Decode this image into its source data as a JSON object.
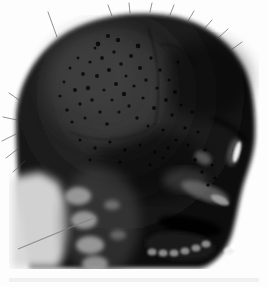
{
  "meta": {
    "image_type": "radiograph"
  },
  "palette": {
    "background": "#fdfdfd",
    "skull_edge_dark": "#050505",
    "skull_mid": "#222222",
    "cranium_light_patch": "#3a3a3a",
    "neck_light": "#d8d8d8",
    "bone_gray": "#a8a8a8",
    "teeth_gray": "#9e9e9e",
    "nasal_highlight": "#fafafa",
    "film_strip": "#ececec"
  },
  "pellets": [
    [
      60,
      96,
      1.6
    ],
    [
      64,
      82,
      1.4
    ],
    [
      67,
      110,
      1.8
    ],
    [
      70,
      68,
      1.5
    ],
    [
      72,
      122,
      1.6
    ],
    [
      75,
      90,
      2.0
    ],
    [
      78,
      58,
      1.4
    ],
    [
      80,
      104,
      1.7
    ],
    [
      83,
      74,
      1.9
    ],
    [
      85,
      118,
      1.5
    ],
    [
      88,
      88,
      2.2
    ],
    [
      90,
      62,
      1.6
    ],
    [
      92,
      100,
      1.8
    ],
    [
      95,
      48,
      1.5
    ],
    [
      97,
      76,
      2.0
    ],
    [
      100,
      112,
      1.7
    ],
    [
      102,
      58,
      1.9
    ],
    [
      104,
      90,
      1.6
    ],
    [
      107,
      124,
      1.8
    ],
    [
      109,
      70,
      2.1
    ],
    [
      112,
      100,
      1.5
    ],
    [
      114,
      52,
      1.7
    ],
    [
      116,
      84,
      2.0
    ],
    [
      119,
      112,
      1.6
    ],
    [
      121,
      64,
      1.8
    ],
    [
      124,
      94,
      2.2
    ],
    [
      126,
      76,
      1.5
    ],
    [
      129,
      106,
      1.7
    ],
    [
      131,
      56,
      1.9
    ],
    [
      134,
      86,
      1.6
    ],
    [
      98,
      44,
      2.4
    ],
    [
      118,
      40,
      2.2
    ],
    [
      138,
      46,
      2.4
    ],
    [
      108,
      36,
      2.0
    ],
    [
      137,
      118,
      1.8
    ],
    [
      140,
      68,
      2.0
    ],
    [
      143,
      98,
      1.6
    ],
    [
      146,
      80,
      1.8
    ],
    [
      148,
      126,
      1.5
    ],
    [
      151,
      58,
      1.7
    ],
    [
      154,
      108,
      2.0
    ],
    [
      157,
      88,
      1.6
    ],
    [
      160,
      70,
      1.8
    ],
    [
      163,
      130,
      1.6
    ],
    [
      166,
      100,
      1.9
    ],
    [
      169,
      80,
      1.5
    ],
    [
      172,
      115,
      1.7
    ],
    [
      175,
      92,
      2.0
    ],
    [
      178,
      62,
      1.5
    ],
    [
      181,
      105,
      1.6
    ],
    [
      185,
      128,
      1.8
    ],
    [
      188,
      145,
      1.6
    ],
    [
      192,
      112,
      1.7
    ],
    [
      195,
      160,
      1.9
    ],
    [
      198,
      132,
      1.5
    ],
    [
      202,
      172,
      1.7
    ],
    [
      205,
      150,
      1.6
    ],
    [
      208,
      185,
      1.8
    ],
    [
      212,
      165,
      1.5
    ],
    [
      215,
      178,
      1.6
    ],
    [
      80,
      140,
      1.5
    ],
    [
      95,
      148,
      1.7
    ],
    [
      110,
      142,
      1.6
    ],
    [
      125,
      150,
      1.8
    ],
    [
      140,
      145,
      1.5
    ],
    [
      155,
      152,
      1.6
    ],
    [
      168,
      148,
      1.7
    ],
    [
      90,
      160,
      1.4
    ],
    [
      120,
      162,
      1.5
    ],
    [
      150,
      165,
      1.6
    ],
    [
      176,
      140,
      1.5
    ],
    [
      163,
      158,
      1.4
    ]
  ],
  "hair_wisps": [
    [
      112,
      16,
      108,
      5
    ],
    [
      130,
      13,
      129,
      3
    ],
    [
      150,
      12,
      152,
      3
    ],
    [
      170,
      15,
      174,
      5
    ],
    [
      188,
      21,
      194,
      11
    ],
    [
      204,
      29,
      212,
      20
    ],
    [
      218,
      38,
      228,
      29
    ],
    [
      231,
      50,
      242,
      42
    ],
    [
      57,
      37,
      48,
      12
    ],
    [
      22,
      102,
      9,
      93
    ],
    [
      17,
      120,
      3,
      117
    ],
    [
      16,
      134,
      2,
      141
    ],
    [
      19,
      148,
      6,
      158
    ],
    [
      25,
      161,
      13,
      172
    ]
  ],
  "artifact_line": [
    18,
    249,
    96,
    217
  ]
}
